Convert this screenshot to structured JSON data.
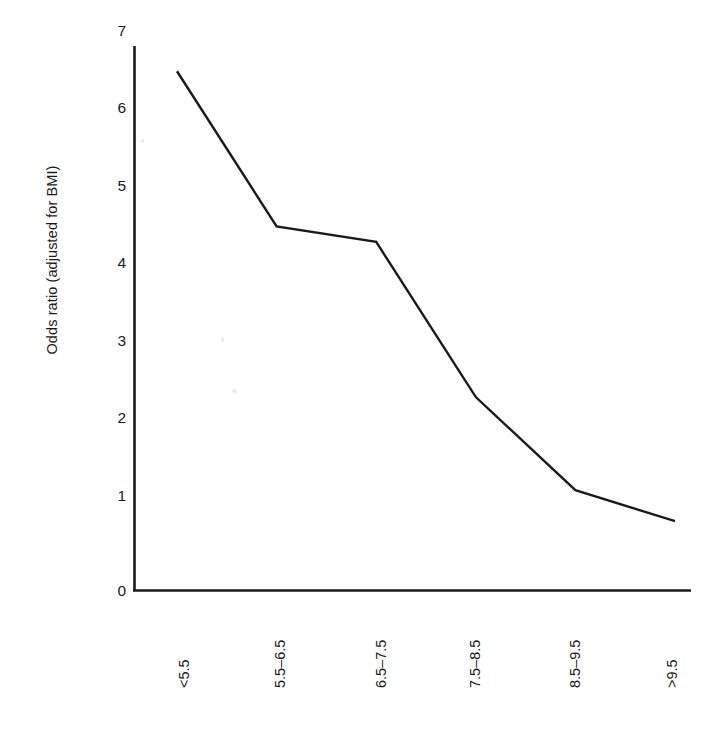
{
  "chart_data": {
    "type": "line",
    "title": "",
    "subtitle": "",
    "xlabel": "Birth weight (lbs)",
    "ylabel": "Odds ratio (adjusted for BMI)",
    "categories": [
      "<5.5",
      "5.5–6.5",
      "6.5–7.5",
      "7.5–8.5",
      "8.5–9.5",
      ">9.5"
    ],
    "values": [
      6.7,
      4.7,
      4.5,
      2.5,
      1.3,
      0.9
    ],
    "series": [
      {
        "name": "Odds ratio (adjusted for BMI)",
        "values": [
          6.7,
          4.7,
          4.5,
          2.5,
          1.3,
          0.9
        ]
      }
    ],
    "ylim": [
      0,
      7
    ],
    "yticks": [
      0,
      1,
      2,
      3,
      4,
      5,
      6,
      7
    ],
    "ytick_labels": [
      "0",
      "1",
      "2",
      "3",
      "4",
      "5",
      "6",
      "7"
    ],
    "xlim_categories": 6,
    "grid": false,
    "legend": "none",
    "line_color": "#1a1a1a",
    "axis_color": "#1a1a1a",
    "background_color": "#ffffff",
    "markers": false
  },
  "axes": {
    "y_title": "Odds ratio (adjusted for BMI)",
    "x_title": "Birth weight (lbs)",
    "y_tick_labels": [
      "7",
      "6",
      "5",
      "4",
      "3",
      "2",
      "1",
      "0"
    ],
    "x_tick_labels": [
      "<5.5",
      "5.5–6.5",
      "6.5–7.5",
      "7.5–8.5",
      "8.5–9.5",
      ">9.5"
    ]
  }
}
